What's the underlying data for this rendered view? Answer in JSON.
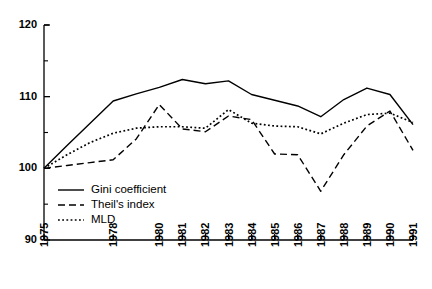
{
  "chart_data": {
    "type": "line",
    "title": "",
    "subtitle": "",
    "xlabel": "",
    "ylabel": "",
    "xlim": [
      1975,
      1991
    ],
    "ylim": [
      90,
      120
    ],
    "grid": false,
    "legend_position": "inside-bottom-left",
    "y_ticks_major": [
      90,
      100,
      110,
      120
    ],
    "y_ticks_minor": [
      95,
      105,
      115
    ],
    "y_tick_labels": [
      "90",
      "100",
      "110",
      "120"
    ],
    "x": [
      1975,
      1976,
      1977,
      1978,
      1979,
      1980,
      1981,
      1982,
      1983,
      1984,
      1985,
      1986,
      1987,
      1988,
      1989,
      1990,
      1991
    ],
    "x_tick_labels": [
      "1975",
      "1978",
      "1980",
      "1981",
      "1982",
      "1983",
      "1984",
      "1985",
      "1986",
      "1987",
      "1988",
      "1989",
      "1990",
      "1991"
    ],
    "x_ticks_labeled": [
      1975,
      1978,
      1980,
      1981,
      1982,
      1983,
      1984,
      1985,
      1986,
      1987,
      1988,
      1989,
      1990,
      1991
    ],
    "series": [
      {
        "name": "Gini coefficient",
        "style": "solid",
        "color": "#000000",
        "values": [
          100.0,
          103.2,
          106.3,
          109.4,
          110.4,
          111.3,
          112.4,
          111.8,
          112.2,
          110.3,
          109.5,
          108.7,
          107.2,
          109.6,
          111.2,
          110.3,
          106.1
        ]
      },
      {
        "name": "Theil's index",
        "style": "dashed",
        "color": "#000000",
        "values": [
          100.0,
          100.4,
          100.8,
          101.2,
          104.1,
          108.9,
          105.5,
          105.1,
          107.3,
          106.8,
          102.0,
          101.9,
          96.8,
          101.9,
          105.9,
          108.0,
          102.5
        ]
      },
      {
        "name": "MLD",
        "style": "dotted",
        "color": "#000000",
        "values": [
          100.0,
          101.9,
          103.6,
          104.9,
          105.6,
          105.8,
          105.8,
          105.6,
          108.2,
          106.3,
          105.9,
          105.8,
          104.8,
          106.3,
          107.5,
          107.7,
          106.4
        ]
      }
    ]
  },
  "legend": {
    "items": [
      {
        "label": "Gini coefficient",
        "style": "solid"
      },
      {
        "label": "Theil's index",
        "style": "dashed"
      },
      {
        "label": "MLD",
        "style": "dotted"
      }
    ]
  }
}
